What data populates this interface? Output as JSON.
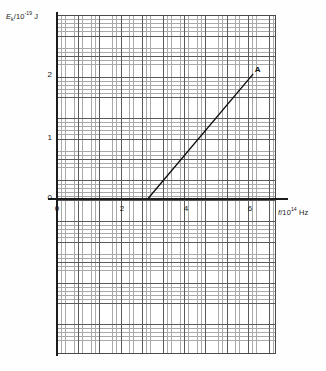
{
  "chart_data": {
    "type": "line",
    "title": "",
    "subtitle": "",
    "xlabel": "f/10^14 Hz",
    "ylabel": "E_k/10^-19 J",
    "xlabel_parts": {
      "var": "f",
      "unit_pre": "/10",
      "exp": "14",
      "unit_post": " Hz"
    },
    "ylabel_parts": {
      "var": "E",
      "sub": "k",
      "unit_pre": "/10",
      "exp": "-19",
      "unit_post": " J"
    },
    "xlim": [
      -0.3,
      6.6
    ],
    "ylim": [
      -3.2,
      2.95
    ],
    "xticks": [
      0,
      2,
      4,
      6
    ],
    "xtick_labels": [
      "0",
      "2",
      "4",
      "6"
    ],
    "yticks": [
      0,
      1,
      2
    ],
    "ytick_labels": [
      "0",
      "1",
      "2"
    ],
    "grid": "graph-paper, minor squares with major gridlines every 5 minor divisions",
    "legend": "none",
    "series": [
      {
        "name": "kinetic energy vs frequency",
        "points": [
          {
            "x": 2.85,
            "y": 0.0
          },
          {
            "x": 6.1,
            "y": 2.0
          }
        ],
        "x_intercept": 2.85,
        "gradient": 0.615,
        "color": "#111111"
      }
    ],
    "annotations": [
      {
        "label": "A",
        "x": 6.1,
        "y": 2.0,
        "note": "labelled end point of the line"
      }
    ]
  },
  "axes": {
    "y_origin_label": "0",
    "x_origin_label": "0"
  }
}
